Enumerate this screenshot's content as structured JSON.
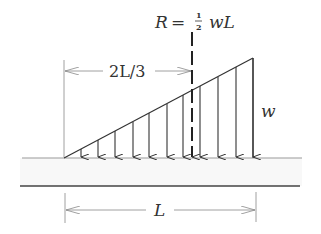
{
  "diagram": {
    "type": "triangular distributed load on beam",
    "resultant": {
      "symbol": "R",
      "equals": "=",
      "frac_num": "1",
      "frac_den": "2",
      "expr": "wL"
    },
    "distance_label": "2L/3",
    "intensity_label": "w",
    "length_label": "L",
    "colors": {
      "line": "#333333",
      "dimension": "#888888",
      "beam_fill": "#f7f7f7"
    }
  }
}
